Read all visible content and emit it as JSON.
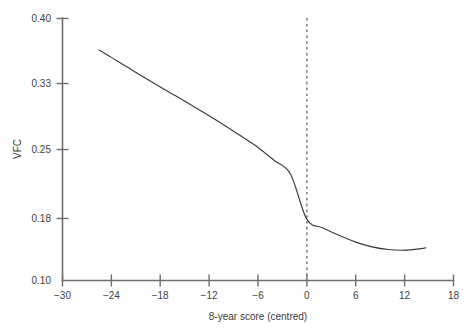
{
  "chart_data": {
    "type": "line",
    "title": "",
    "xlabel": "8-year score (centred)",
    "ylabel": "VFC",
    "xlim": [
      -30,
      18
    ],
    "ylim": [
      0.1,
      0.4
    ],
    "grid": false,
    "legend": "none",
    "x_ticks": [
      -30,
      -24,
      -18,
      -12,
      -6,
      0,
      6,
      12,
      18
    ],
    "x_tick_labels": [
      "−30",
      "−24",
      "−18",
      "−12",
      "−6",
      "0",
      "6",
      "12",
      "18"
    ],
    "y_ticks": [
      0.1,
      0.18,
      0.25,
      0.33,
      0.4
    ],
    "y_tick_labels": [
      "0.10",
      "0.18",
      "0.25",
      "0.33",
      "0.40"
    ],
    "y_scale_note": "non-linear (transformed) vertical axis; tick spacing unequal",
    "y_tick_pixels": [
      280,
      218,
      149,
      83,
      18
    ],
    "annotations": [
      {
        "name": "reference-line",
        "type": "vertical-dashed-line",
        "x": 0,
        "label": ""
      }
    ],
    "series": [
      {
        "name": "fitted VFC curve",
        "style": "solid",
        "color": "#3a3a3a",
        "x": [
          -25.5,
          -24,
          -22,
          -20,
          -18,
          -16,
          -14,
          -12,
          -10,
          -8,
          -6,
          -4,
          -2,
          0,
          2,
          4,
          6,
          8,
          10,
          12,
          14,
          14.6
        ],
        "y": [
          0.3655,
          0.3576,
          0.3469,
          0.3361,
          0.3251,
          0.3138,
          0.3022,
          0.2902,
          0.2779,
          0.2651,
          0.2519,
          0.2383,
          0.2243,
          0.1782,
          0.1672,
          0.1573,
          0.1489,
          0.1428,
          0.1393,
          0.1385,
          0.1404,
          0.1416
        ]
      }
    ]
  },
  "axis": {
    "y_label": "VFC",
    "x_label": "8-year score (centred)"
  }
}
